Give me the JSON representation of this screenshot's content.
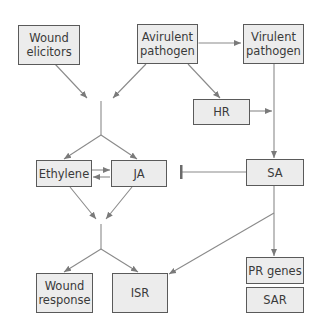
{
  "diagram": {
    "nodes": {
      "wound_elicitors": {
        "label": "Wound\nelicitors"
      },
      "avirulent_pathogen": {
        "label": "Avirulent\npathogen"
      },
      "virulent_pathogen": {
        "label": "Virulent\npathogen"
      },
      "hr": {
        "label": "HR"
      },
      "ethylene": {
        "label": "Ethylene"
      },
      "ja": {
        "label": "JA"
      },
      "sa": {
        "label": "SA"
      },
      "wound_response": {
        "label": "Wound\nresponse"
      },
      "isr": {
        "label": "ISR"
      },
      "pr_genes": {
        "label": "PR genes"
      },
      "sar": {
        "label": "SAR"
      }
    },
    "edges": [
      {
        "from": "wound_elicitors",
        "to": "junction_1",
        "type": "arrow"
      },
      {
        "from": "avirulent_pathogen",
        "to": "junction_1",
        "type": "arrow"
      },
      {
        "from": "avirulent_pathogen",
        "to": "virulent_pathogen",
        "type": "bidirectional"
      },
      {
        "from": "avirulent_pathogen",
        "to": "hr",
        "type": "arrow"
      },
      {
        "from": "hr",
        "to": "sa_path",
        "type": "arrow"
      },
      {
        "from": "virulent_pathogen",
        "to": "sa",
        "type": "arrow"
      },
      {
        "from": "junction_1",
        "to": "ethylene",
        "type": "arrow"
      },
      {
        "from": "junction_1",
        "to": "ja",
        "type": "arrow"
      },
      {
        "from": "ethylene",
        "to": "ja",
        "type": "arrow"
      },
      {
        "from": "ja",
        "to": "ethylene",
        "type": "arrow"
      },
      {
        "from": "sa",
        "to": "ja",
        "type": "inhibition"
      },
      {
        "from": "ethylene",
        "to": "junction_2",
        "type": "arrow"
      },
      {
        "from": "ja",
        "to": "junction_2",
        "type": "arrow"
      },
      {
        "from": "junction_2",
        "to": "wound_response",
        "type": "arrow"
      },
      {
        "from": "junction_2",
        "to": "isr",
        "type": "arrow"
      },
      {
        "from": "sa",
        "to": "isr",
        "type": "arrow"
      },
      {
        "from": "sa",
        "to": "pr_genes",
        "type": "arrow"
      }
    ],
    "colors": {
      "box_fill": "#ececec",
      "box_border": "#5a5a5a",
      "edge": "#8a8a8a",
      "text": "#3a3a3a"
    }
  }
}
